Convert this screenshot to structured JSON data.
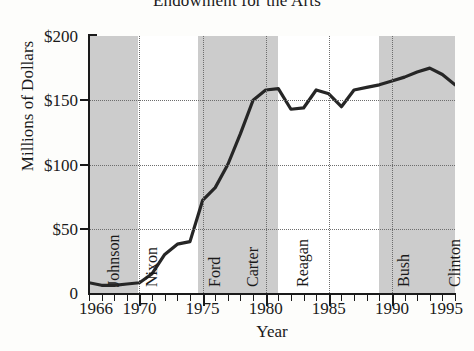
{
  "chart_data": {
    "type": "line",
    "title": "Endowment for the Arts",
    "xlabel": "Year",
    "ylabel": "Millions of Dollars",
    "xlim": [
      1966,
      1995
    ],
    "ylim": [
      0,
      200
    ],
    "grid": true,
    "legend": "none",
    "ytick_labels": [
      "$200",
      "$150",
      "$100",
      "$50",
      "0"
    ],
    "ytick_values": [
      200,
      150,
      100,
      50,
      0
    ],
    "xtick_labels": [
      "1966",
      "1970",
      "1975",
      "1980",
      "1985",
      "1990",
      "1995"
    ],
    "xtick_values": [
      1966,
      1970,
      1975,
      1980,
      1985,
      1990,
      1995
    ],
    "x": [
      1966,
      1967,
      1968,
      1969,
      1970,
      1971,
      1972,
      1973,
      1974,
      1975,
      1976,
      1977,
      1978,
      1979,
      1980,
      1981,
      1982,
      1983,
      1984,
      1985,
      1986,
      1987,
      1988,
      1989,
      1990,
      1991,
      1992,
      1993,
      1994,
      1995
    ],
    "values": [
      8,
      6,
      6,
      7,
      8,
      15,
      30,
      38,
      40,
      72,
      82,
      100,
      124,
      150,
      158,
      159,
      143,
      144,
      158,
      155,
      145,
      158,
      160,
      162,
      165,
      168,
      172,
      175,
      170,
      162
    ],
    "series_name": "Endowment for the Arts appropriation",
    "annotations": [
      {
        "label": "Johnson",
        "start": 1966,
        "end": 1969,
        "shaded": true
      },
      {
        "label": "Nixon",
        "start": 1969,
        "end": 1974,
        "shaded": false
      },
      {
        "label": "Ford",
        "start": 1974,
        "end": 1977,
        "shaded": true
      },
      {
        "label": "Carter",
        "start": 1977,
        "end": 1981,
        "shaded": true
      },
      {
        "label": "Reagan",
        "start": 1981,
        "end": 1989,
        "shaded": false
      },
      {
        "label": "Bush",
        "start": 1989,
        "end": 1993,
        "shaded": true
      },
      {
        "label": "Clinton",
        "start": 1993,
        "end": 1995,
        "shaded": true
      }
    ],
    "shaded_bands": [
      {
        "start": 1966,
        "end": 1969.9
      },
      {
        "start": 1974.6,
        "end": 1981.0
      },
      {
        "start": 1989.0,
        "end": 1995.0
      }
    ],
    "colors": {
      "line": "#262626",
      "band": "#cccccc",
      "grid": "#6d6d6d",
      "axis": "#1a1a1a",
      "background": "#ffffff"
    }
  }
}
